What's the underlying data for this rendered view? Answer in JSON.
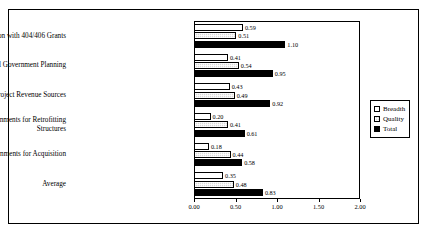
{
  "chart_data": {
    "type": "bar",
    "orientation": "horizontal",
    "title": "",
    "xlabel": "",
    "ylabel": "",
    "xlim": [
      0.0,
      2.0
    ],
    "xticks": [
      "0.00",
      "0.50",
      "1.00",
      "1.50",
      "2.00"
    ],
    "xtick_values": [
      0.0,
      0.5,
      1.0,
      1.5,
      2.0
    ],
    "grid": false,
    "legend_position": "right",
    "show_data_labels": true,
    "categories": [
      "Finance Mitigation with 404/406 Grants",
      "Financial Aid for Local Government Planning",
      "Develop Planning and Project Revenue Sources",
      "Financial Aid to Local Governments for Retrofitting\nStructures",
      "Financial Aid to Local Governments for Acquisition",
      "Average"
    ],
    "series": [
      {
        "name": "Breadth",
        "color": "#ffffff",
        "values": [
          0.59,
          0.41,
          0.43,
          0.2,
          0.18,
          0.35
        ],
        "labels": [
          "0.59",
          "0.41",
          "0.43",
          "0.20",
          "0.18",
          "0.35"
        ]
      },
      {
        "name": "Quality",
        "color": "#d8d8d8",
        "values": [
          0.51,
          0.54,
          0.49,
          0.41,
          0.44,
          0.48
        ],
        "labels": [
          "0.51",
          "0.54",
          "0.49",
          "0.41",
          "0.44",
          "0.48"
        ]
      },
      {
        "name": "Total",
        "color": "#000000",
        "values": [
          1.1,
          0.95,
          0.92,
          0.61,
          0.58,
          0.83
        ],
        "labels": [
          "1.10",
          "0.95",
          "0.92",
          "0.61",
          "0.58",
          "0.83"
        ]
      }
    ]
  },
  "legend": {
    "items": [
      {
        "label": "Breadth"
      },
      {
        "label": "Quality"
      },
      {
        "label": "Total"
      }
    ]
  }
}
